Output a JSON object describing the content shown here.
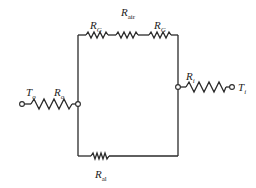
{
  "diagram": {
    "type": "thermal-resistance-network",
    "stroke_color": "#2a2a2a",
    "labels": {
      "R_air": {
        "main": "R",
        "sub": "air"
      },
      "R_G_left": {
        "main": "R",
        "sub": "G"
      },
      "R_G_right": {
        "main": "R",
        "sub": "G"
      },
      "T_o": {
        "main": "T",
        "sub": "o"
      },
      "R_o": {
        "main": "R",
        "sub": "o"
      },
      "R_i": {
        "main": "R",
        "sub": "i"
      },
      "T_i": {
        "main": "T",
        "sub": "i"
      },
      "R_al": {
        "main": "R",
        "sub": "al"
      }
    },
    "nodes": [
      "T_o terminal",
      "left junction",
      "right junction",
      "T_i terminal"
    ],
    "branches": [
      {
        "name": "outer",
        "resistors": [
          "R_o"
        ],
        "from": "T_o",
        "to": "left junction"
      },
      {
        "name": "upper",
        "resistors": [
          "R_G",
          "R_air",
          "R_G"
        ],
        "from": "left junction",
        "to": "right junction"
      },
      {
        "name": "lower",
        "resistors": [
          "R_al"
        ],
        "from": "left junction",
        "to": "right junction"
      },
      {
        "name": "inner",
        "resistors": [
          "R_i"
        ],
        "from": "right junction",
        "to": "T_i"
      }
    ]
  }
}
